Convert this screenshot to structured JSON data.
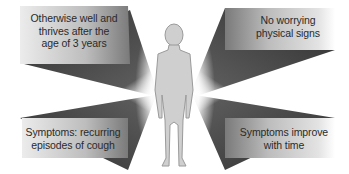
{
  "diagram": {
    "central_figure": "child-silhouette",
    "colors": {
      "box_light": "#e6e6e6",
      "box_dark": "#8a8a8a",
      "ray_dark": "#3a3a3a",
      "figure_fill": "#cfcfcf",
      "figure_stroke": "#9a9a9a",
      "text": "#2a2a2a"
    },
    "panels": [
      {
        "position": "top-left",
        "line1": "Otherwise well and",
        "line2": "thrives after the",
        "line3": "age of 3 years"
      },
      {
        "position": "top-right",
        "line1": "No worrying",
        "line2": "physical signs"
      },
      {
        "position": "bottom-left",
        "line1": "Symptoms: recurring",
        "line2": "episodes of cough"
      },
      {
        "position": "bottom-right",
        "line1": "Symptoms improve",
        "line2": "with time"
      }
    ]
  }
}
